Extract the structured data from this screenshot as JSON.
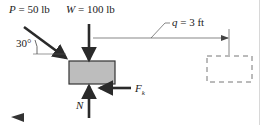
{
  "diagram": {
    "type": "free-body-diagram",
    "labels": {
      "P": {
        "symbol": "P",
        "value": " = 50 lb"
      },
      "W": {
        "symbol": "W",
        "value": " = 100 lb"
      },
      "angle": "30°",
      "q": {
        "symbol": "q",
        "value": " = 3 ft"
      },
      "N": "N",
      "Fk": {
        "symbol": "F",
        "sub": "k"
      }
    },
    "colors": {
      "box_fill": "#bdbdbd",
      "box_stroke": "#333333",
      "arrow": "#2a2a2a",
      "line": "#555555",
      "dashed": "#777777"
    },
    "nav": {
      "back_icon": "◀"
    }
  }
}
